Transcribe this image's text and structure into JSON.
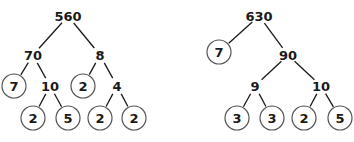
{
  "trees": [
    {
      "root": "560",
      "nodes": [
        {
          "id": "a",
          "label": "560",
          "x": 68,
          "y": 16,
          "circled": false
        },
        {
          "id": "b",
          "label": "70",
          "x": 33,
          "y": 55,
          "circled": false
        },
        {
          "id": "c",
          "label": "8",
          "x": 100,
          "y": 55,
          "circled": false
        },
        {
          "id": "d",
          "label": "7",
          "x": 14,
          "y": 86,
          "circled": true
        },
        {
          "id": "e",
          "label": "10",
          "x": 50,
          "y": 86,
          "circled": false
        },
        {
          "id": "f",
          "label": "2",
          "x": 83,
          "y": 86,
          "circled": true
        },
        {
          "id": "g",
          "label": "4",
          "x": 117,
          "y": 86,
          "circled": false
        },
        {
          "id": "h",
          "label": "2",
          "x": 33,
          "y": 118,
          "circled": true
        },
        {
          "id": "i",
          "label": "5",
          "x": 68,
          "y": 118,
          "circled": true
        },
        {
          "id": "j",
          "label": "2",
          "x": 100,
          "y": 118,
          "circled": true
        },
        {
          "id": "k",
          "label": "2",
          "x": 134,
          "y": 118,
          "circled": true
        }
      ],
      "edges": [
        [
          "a",
          "b"
        ],
        [
          "a",
          "c"
        ],
        [
          "b",
          "d"
        ],
        [
          "b",
          "e"
        ],
        [
          "c",
          "f"
        ],
        [
          "c",
          "g"
        ],
        [
          "e",
          "h"
        ],
        [
          "e",
          "i"
        ],
        [
          "g",
          "j"
        ],
        [
          "g",
          "k"
        ]
      ]
    },
    {
      "root": "630",
      "nodes": [
        {
          "id": "a",
          "label": "630",
          "x": 259,
          "y": 16,
          "circled": false
        },
        {
          "id": "b",
          "label": "7",
          "x": 219,
          "y": 52,
          "circled": true
        },
        {
          "id": "c",
          "label": "90",
          "x": 288,
          "y": 55,
          "circled": false
        },
        {
          "id": "d",
          "label": "9",
          "x": 255,
          "y": 86,
          "circled": false
        },
        {
          "id": "e",
          "label": "10",
          "x": 321,
          "y": 86,
          "circled": false
        },
        {
          "id": "f",
          "label": "3",
          "x": 237,
          "y": 118,
          "circled": true
        },
        {
          "id": "g",
          "label": "3",
          "x": 272,
          "y": 118,
          "circled": true
        },
        {
          "id": "h",
          "label": "2",
          "x": 304,
          "y": 118,
          "circled": true
        },
        {
          "id": "i",
          "label": "5",
          "x": 340,
          "y": 118,
          "circled": true
        }
      ],
      "edges": [
        [
          "a",
          "b"
        ],
        [
          "a",
          "c"
        ],
        [
          "c",
          "d"
        ],
        [
          "c",
          "e"
        ],
        [
          "d",
          "f"
        ],
        [
          "d",
          "g"
        ],
        [
          "e",
          "h"
        ],
        [
          "e",
          "i"
        ]
      ]
    }
  ],
  "style": {
    "circle_radius": 12,
    "text_color": "#1a1a1a",
    "circle_stroke": "#555555"
  }
}
